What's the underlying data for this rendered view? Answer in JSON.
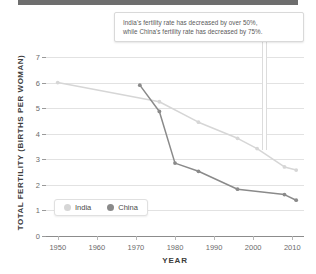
{
  "callout": {
    "line1": "India's fertility rate has decreased by over 50%,",
    "line2": "while China's fertility rate has decreased by 75%."
  },
  "legend": {
    "items": [
      {
        "label": "India",
        "color": "#d6d6d6"
      },
      {
        "label": "China",
        "color": "#8a8a8a"
      }
    ]
  },
  "chart_data": {
    "type": "line",
    "title": "",
    "xlabel": "YEAR",
    "ylabel": "TOTAL FERTILITY (BIRTHS PER WOMAN)",
    "xlim": [
      1947,
      2013
    ],
    "ylim": [
      0,
      7
    ],
    "xticks": [
      1950,
      1960,
      1970,
      1980,
      1990,
      2000,
      2010
    ],
    "yticks": [
      0,
      1,
      2,
      3,
      4,
      5,
      6,
      7
    ],
    "grid": true,
    "legend_position": "inside-lower-left",
    "series": [
      {
        "name": "India",
        "color": "#d6d6d6",
        "points": [
          {
            "x": 1950,
            "y": 6.0
          },
          {
            "x": 1976,
            "y": 5.25
          },
          {
            "x": 1986,
            "y": 4.45
          },
          {
            "x": 1996,
            "y": 3.82
          },
          {
            "x": 2001,
            "y": 3.42
          },
          {
            "x": 2008,
            "y": 2.7
          },
          {
            "x": 2011,
            "y": 2.58
          }
        ]
      },
      {
        "name": "China",
        "color": "#8a8a8a",
        "points": [
          {
            "x": 1971,
            "y": 5.9
          },
          {
            "x": 1976,
            "y": 4.87
          },
          {
            "x": 1980,
            "y": 2.85
          },
          {
            "x": 1986,
            "y": 2.53
          },
          {
            "x": 1996,
            "y": 1.83
          },
          {
            "x": 2008,
            "y": 1.62
          },
          {
            "x": 2011,
            "y": 1.4
          }
        ]
      }
    ]
  }
}
